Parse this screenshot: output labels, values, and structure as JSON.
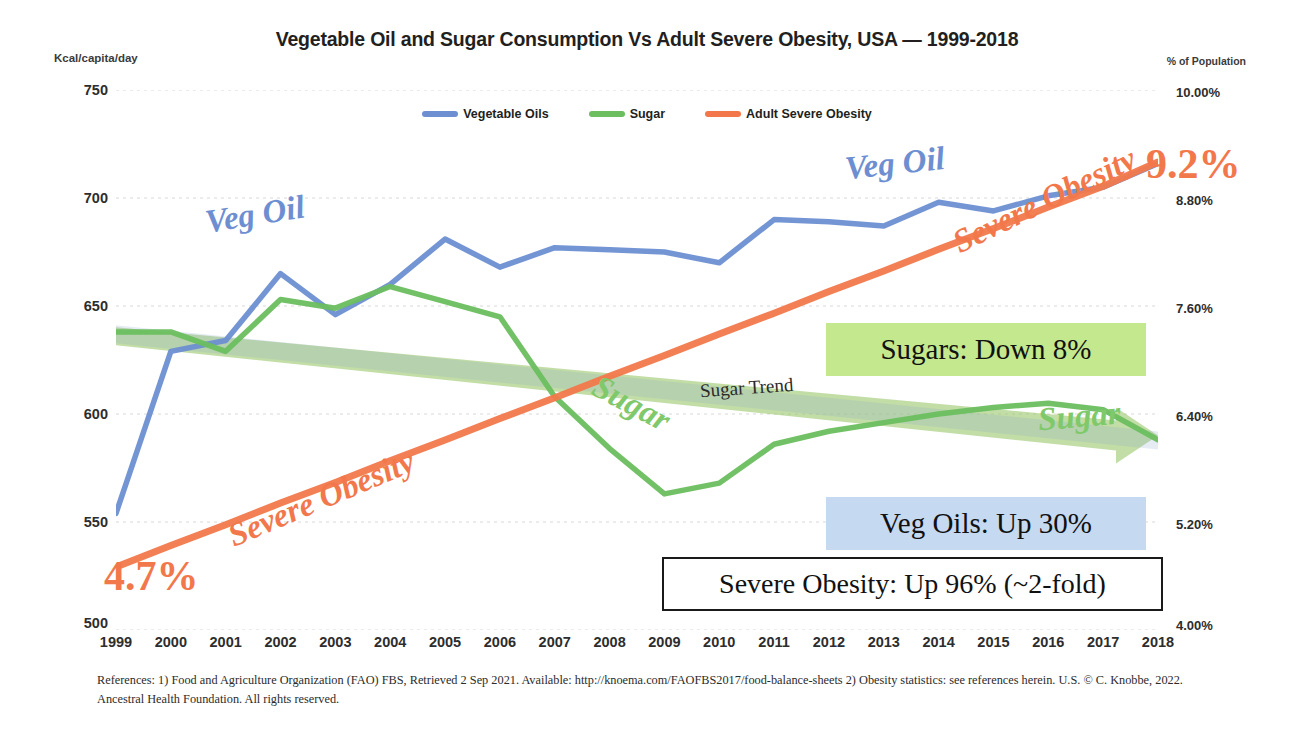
{
  "header": {
    "title": "Vegetable Oil and Sugar Consumption Vs Adult Severe Obesity, USA — 1999-2018",
    "left_axis_title": "Kcal/capita/day",
    "right_axis_title": "% of Population"
  },
  "legend": {
    "items": [
      {
        "label": "Vegetable Oils",
        "color": "#6d8fd2"
      },
      {
        "label": "Sugar",
        "color": "#6cbe5f"
      },
      {
        "label": "Adult Severe Obesity",
        "color": "#f2784b"
      }
    ]
  },
  "inline_labels": {
    "veg_oil_1": "Veg Oil",
    "veg_oil_2": "Veg Oil",
    "sugar_1": "Sugar",
    "sugar_2": "Sugar",
    "obesity_1": "Severe Obesity",
    "obesity_2": "Severe Obesity",
    "sugar_trend": "Sugar Trend"
  },
  "endpoint_values": {
    "start": "4.7%",
    "end": "9.2%"
  },
  "callouts": {
    "sugars": "Sugars: Down 8%",
    "veg_oils": "Veg Oils: Up 30%",
    "obesity": "Severe Obesity: Up 96% (~2-fold)"
  },
  "footer": {
    "text": "References: 1) Food and Agriculture Organization (FAO) FBS, Retrieved 2 Sep 2021. Available: http://knoema.com/FAOFBS2017/food-balance-sheets  2) Obesity statistics: see references herein. U.S. © C. Knobbe, 2022. Ancestral Health Foundation. All rights reserved."
  },
  "chart_data": {
    "type": "line",
    "title": "Vegetable Oil and Sugar Consumption Vs Adult Severe Obesity, USA — 1999-2018",
    "xlabel": "",
    "ylabel": "Kcal/capita/day",
    "y2label": "% of Population",
    "grid": true,
    "legend_position": "top-center",
    "x": [
      1999,
      2000,
      2001,
      2002,
      2003,
      2004,
      2005,
      2006,
      2007,
      2008,
      2009,
      2010,
      2011,
      2012,
      2013,
      2014,
      2015,
      2016,
      2017,
      2018
    ],
    "categories": [
      "1999",
      "2000",
      "2001",
      "2002",
      "2003",
      "2004",
      "2005",
      "2006",
      "2007",
      "2008",
      "2009",
      "2010",
      "2011",
      "2012",
      "2013",
      "2014",
      "2015",
      "2016",
      "2017",
      "2018"
    ],
    "ylim": [
      500,
      750
    ],
    "yticks": [
      500,
      550,
      600,
      650,
      700,
      750
    ],
    "ytick_labels": [
      "500",
      "550",
      "600",
      "650",
      "700",
      "750"
    ],
    "y2lim": [
      4.0,
      10.0
    ],
    "y2ticks": [
      4.0,
      5.2,
      6.4,
      7.6,
      8.8,
      10.0
    ],
    "y2tick_labels": [
      "4.00%",
      "5.20%",
      "6.40%",
      "7.60%",
      "8.80%",
      "10.00%"
    ],
    "series": [
      {
        "name": "Vegetable Oils",
        "color": "#6d8fd2",
        "axis": "left",
        "unit": "Kcal/capita/day",
        "values": [
          554,
          629,
          634,
          665,
          646,
          660,
          681,
          668,
          677,
          676,
          675,
          670,
          690,
          689,
          687,
          698,
          694,
          701,
          705,
          716
        ]
      },
      {
        "name": "Sugar",
        "color": "#6cbe5f",
        "axis": "left",
        "unit": "Kcal/capita/day",
        "values": [
          638,
          638,
          629,
          653,
          649,
          659,
          652,
          645,
          608,
          584,
          563,
          568,
          586,
          592,
          596,
          600,
          603,
          605,
          602,
          588
        ]
      },
      {
        "name": "Adult Severe Obesity",
        "color": "#f2784b",
        "axis": "right",
        "unit": "% of Population",
        "values": [
          4.7,
          4.94,
          5.17,
          5.41,
          5.64,
          5.88,
          6.11,
          6.35,
          6.58,
          6.82,
          7.05,
          7.29,
          7.52,
          7.76,
          7.99,
          8.23,
          8.46,
          8.7,
          8.93,
          9.2
        ]
      }
    ],
    "trend_lines": [
      {
        "name": "Sugar Trend",
        "color": "#9dc86f",
        "start": {
          "x": 1999,
          "y": 636
        },
        "end": {
          "x": 2018,
          "y": 591
        }
      }
    ],
    "annotations": [
      {
        "text": "4.7%",
        "series": "Adult Severe Obesity",
        "x": 1999,
        "value": 4.7
      },
      {
        "text": "9.2%",
        "series": "Adult Severe Obesity",
        "x": 2018,
        "value": 9.2
      },
      {
        "text": "Sugars: Down 8%",
        "kind": "callout"
      },
      {
        "text": "Veg Oils: Up 30%",
        "kind": "callout"
      },
      {
        "text": "Severe Obesity: Up 96% (~2-fold)",
        "kind": "callout"
      }
    ]
  }
}
